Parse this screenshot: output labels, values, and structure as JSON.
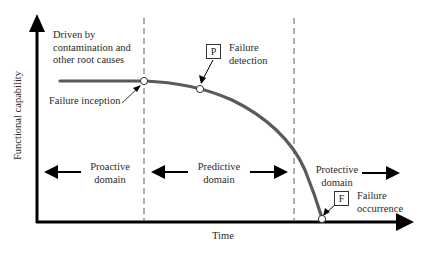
{
  "axes": {
    "y_label": "Functional capability",
    "x_label": "Time"
  },
  "annotations": {
    "driver_note": [
      "Driven by",
      "contamination and",
      "other root causes"
    ],
    "failure_inception": "Failure inception",
    "failure_detection": {
      "marker": "P",
      "lines": [
        "Failure",
        "detection"
      ]
    },
    "failure_occurrence": {
      "marker": "F",
      "lines": [
        "Failure",
        "occurrence"
      ]
    }
  },
  "domains": [
    {
      "lines": [
        "Proactive",
        "domain"
      ]
    },
    {
      "lines": [
        "Predictive",
        "domain"
      ]
    },
    {
      "lines": [
        "Protective",
        "domain"
      ]
    }
  ],
  "colors": {
    "axis": "#000000",
    "curve": "#555555",
    "dashed": "#777777",
    "text": "#2a2a2a"
  }
}
